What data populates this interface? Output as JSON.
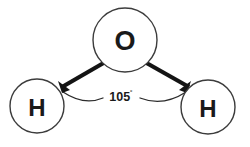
{
  "diagram": {
    "background_color": "#ffffff",
    "atoms": [
      {
        "id": "oxygen",
        "label": "O",
        "cx": 125,
        "cy": 40,
        "r": 32
      },
      {
        "id": "hydrogen-left",
        "label": "H",
        "cx": 37,
        "cy": 106,
        "r": 27
      },
      {
        "id": "hydrogen-right",
        "label": "H",
        "cx": 208,
        "cy": 107,
        "r": 27
      }
    ],
    "bonds": [
      {
        "id": "bond-o-h-left",
        "from": "oxygen",
        "to": "hydrogen-left",
        "x1": 107,
        "y1": 62,
        "x2": 60,
        "y2": 88
      },
      {
        "id": "bond-o-h-right",
        "from": "oxygen",
        "to": "hydrogen-right",
        "x1": 143,
        "y1": 62,
        "x2": 190,
        "y2": 88
      }
    ],
    "angle": {
      "value": "105",
      "degree_symbol": "˚",
      "full_label": "105˚",
      "arc_color": "#2b2b2b",
      "arrow_color": "#141414"
    },
    "stroke_colors": {
      "circle": "#3c3c3c",
      "bond": "#141414",
      "text": "#1a1a1a"
    }
  }
}
